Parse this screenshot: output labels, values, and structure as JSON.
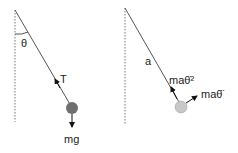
{
  "diagrams": [
    {
      "name": "force-diagram",
      "labels": {
        "angle": "θ",
        "tension": "T",
        "weight": "mg"
      },
      "bob_color": "#6e6e6e"
    },
    {
      "name": "acceleration-diagram",
      "labels": {
        "length": "a",
        "radial": "maθ̇²",
        "tangential": "maθ̈"
      },
      "bob_color": "#c8c8c8"
    }
  ],
  "colors": {
    "line": "#555555",
    "arrow": "#111111"
  }
}
